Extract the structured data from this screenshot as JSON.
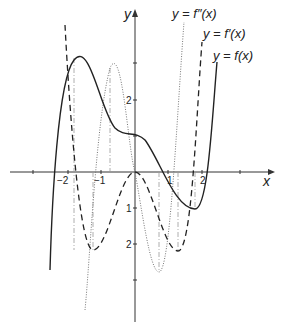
{
  "figure": {
    "axis_labels": {
      "x": "x",
      "y": "y"
    },
    "x_ticks": [
      {
        "value": -2,
        "label": "−2"
      },
      {
        "value": -1,
        "label": "−1"
      },
      {
        "value": 1,
        "label": "1"
      },
      {
        "value": 2,
        "label": "2"
      }
    ],
    "y_ticks": [
      {
        "value": 2,
        "label": "2"
      },
      {
        "value": -1,
        "label": "1"
      },
      {
        "value": -2,
        "label": "2"
      }
    ],
    "legend": {
      "f2": "y = f″(x)",
      "f1": "y = f′(x)",
      "f0": "y = f(x)"
    },
    "styles": {
      "f": "solid",
      "f_prime": "dashed",
      "f_double_prime": "dotted",
      "guides": "dash-dot"
    },
    "colors": {
      "ink": "#222222",
      "guide": "#888888",
      "dotted": "#777777"
    }
  }
}
